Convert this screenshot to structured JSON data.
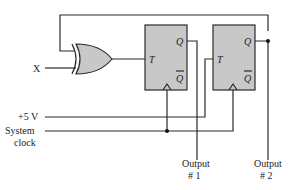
{
  "diagram": {
    "type": "sequential-logic-circuit",
    "inputs": {
      "x_label": "X",
      "vcc_label": "+5 V",
      "clock_label_line1": "System",
      "clock_label_line2": "clock"
    },
    "gate": {
      "kind": "XOR"
    },
    "flipflops": [
      {
        "id": "ff1",
        "t_label": "T",
        "q_label": "Q",
        "qbar_label": "Q"
      },
      {
        "id": "ff2",
        "t_label": "T",
        "q_label": "Q",
        "qbar_label": "Q"
      }
    ],
    "outputs": [
      {
        "line1": "Output",
        "line2": "# 1"
      },
      {
        "line1": "Output",
        "line2": "# 2"
      }
    ],
    "colors": {
      "box_fill": "#c8c8c8",
      "wire": "#2a2a2a"
    }
  }
}
